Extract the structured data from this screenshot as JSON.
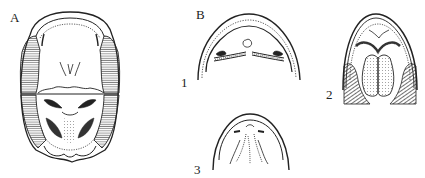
{
  "figure": {
    "panels": [
      {
        "id": "A",
        "label": "A",
        "description": "full skull ventral view with hatched lateral regions"
      },
      {
        "id": "B",
        "label": "B",
        "description": "group of three palate views"
      }
    ],
    "subfigures": [
      {
        "id": "1",
        "label": "1"
      },
      {
        "id": "2",
        "label": "2"
      },
      {
        "id": "3",
        "label": "3"
      }
    ]
  },
  "colors": {
    "line": "#222222",
    "hatch": "#333333",
    "background": "#ffffff"
  }
}
